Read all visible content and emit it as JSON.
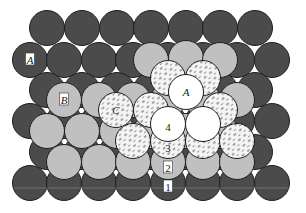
{
  "diagram": {
    "type": "close-packed-sphere-layers",
    "radius": 17.5,
    "colors": {
      "layer1": "#4b4b4b",
      "layer2": "#c0c0c0",
      "layer3": "#f2f2f2",
      "layer3_hatch": "#555555",
      "layer4": "#ffffff",
      "outline": "#1e1e1e",
      "label_box": "#ffffff"
    },
    "labels": {
      "site_a_bottom": "A",
      "site_b": "B",
      "site_c": "C",
      "site_a_top": "A",
      "layer_1": "1",
      "layer_2": "2",
      "layer_3": "3",
      "layer_4": "4"
    },
    "layers": [
      {
        "name": "layer-1",
        "fill": "layer1",
        "spheres": [
          [
            47,
            28
          ],
          [
            82,
            28
          ],
          [
            117,
            28
          ],
          [
            151,
            28
          ],
          [
            186,
            28
          ],
          [
            220,
            28
          ],
          [
            255,
            28
          ],
          [
            30,
            60
          ],
          [
            64,
            60
          ],
          [
            99,
            60
          ],
          [
            133,
            60
          ],
          [
            168,
            60
          ],
          [
            203,
            60
          ],
          [
            237,
            60
          ],
          [
            272,
            60
          ],
          [
            47,
            90
          ],
          [
            82,
            90
          ],
          [
            117,
            90
          ],
          [
            151,
            90
          ],
          [
            186,
            90
          ],
          [
            220,
            90
          ],
          [
            255,
            90
          ],
          [
            30,
            121
          ],
          [
            64,
            121
          ],
          [
            99,
            121
          ],
          [
            133,
            121
          ],
          [
            168,
            121
          ],
          [
            203,
            121
          ],
          [
            237,
            121
          ],
          [
            272,
            121
          ],
          [
            47,
            152
          ],
          [
            82,
            152
          ],
          [
            117,
            152
          ],
          [
            151,
            152
          ],
          [
            186,
            152
          ],
          [
            220,
            152
          ],
          [
            255,
            152
          ],
          [
            30,
            183
          ],
          [
            64,
            183
          ],
          [
            99,
            183
          ],
          [
            133,
            183
          ],
          [
            168,
            183
          ],
          [
            203,
            183
          ],
          [
            237,
            183
          ],
          [
            272,
            183
          ]
        ]
      },
      {
        "name": "layer-2",
        "fill": "layer2",
        "spheres": [
          [
            151,
            60
          ],
          [
            186,
            58
          ],
          [
            220,
            60
          ],
          [
            64,
            100
          ],
          [
            99,
            100
          ],
          [
            133,
            100
          ],
          [
            168,
            100
          ],
          [
            203,
            100
          ],
          [
            237,
            100
          ],
          [
            47,
            131
          ],
          [
            82,
            131
          ],
          [
            117,
            131
          ],
          [
            151,
            131
          ],
          [
            186,
            131
          ],
          [
            220,
            131
          ],
          [
            64,
            162
          ],
          [
            99,
            162
          ],
          [
            133,
            162
          ],
          [
            168,
            162
          ],
          [
            203,
            162
          ],
          [
            237,
            162
          ]
        ]
      },
      {
        "name": "layer-3",
        "fill": "layer3",
        "hatched": true,
        "spheres": [
          [
            168,
            78
          ],
          [
            203,
            78
          ],
          [
            116,
            110
          ],
          [
            151,
            110
          ],
          [
            220,
            110
          ],
          [
            133,
            141
          ],
          [
            168,
            141
          ],
          [
            203,
            141
          ],
          [
            237,
            141
          ]
        ]
      },
      {
        "name": "layer-4",
        "fill": "layer4",
        "spheres": [
          [
            186,
            92
          ],
          [
            168,
            124
          ],
          [
            203,
            124
          ]
        ]
      }
    ],
    "label_positions": {
      "site_a_bottom": {
        "x": 30,
        "y": 60,
        "boxed": true
      },
      "site_b": {
        "x": 64,
        "y": 100,
        "boxed": true
      },
      "site_c": {
        "x": 116,
        "y": 110,
        "boxed": false
      },
      "site_a_top": {
        "x": 186,
        "y": 92,
        "boxed": false
      },
      "layer_4": {
        "x": 168,
        "y": 127,
        "boxed": false
      },
      "layer_3": {
        "x": 168,
        "y": 148,
        "boxed": false
      },
      "layer_2": {
        "x": 168,
        "y": 168,
        "boxed": true
      },
      "layer_1": {
        "x": 168,
        "y": 187,
        "boxed": true
      }
    }
  }
}
